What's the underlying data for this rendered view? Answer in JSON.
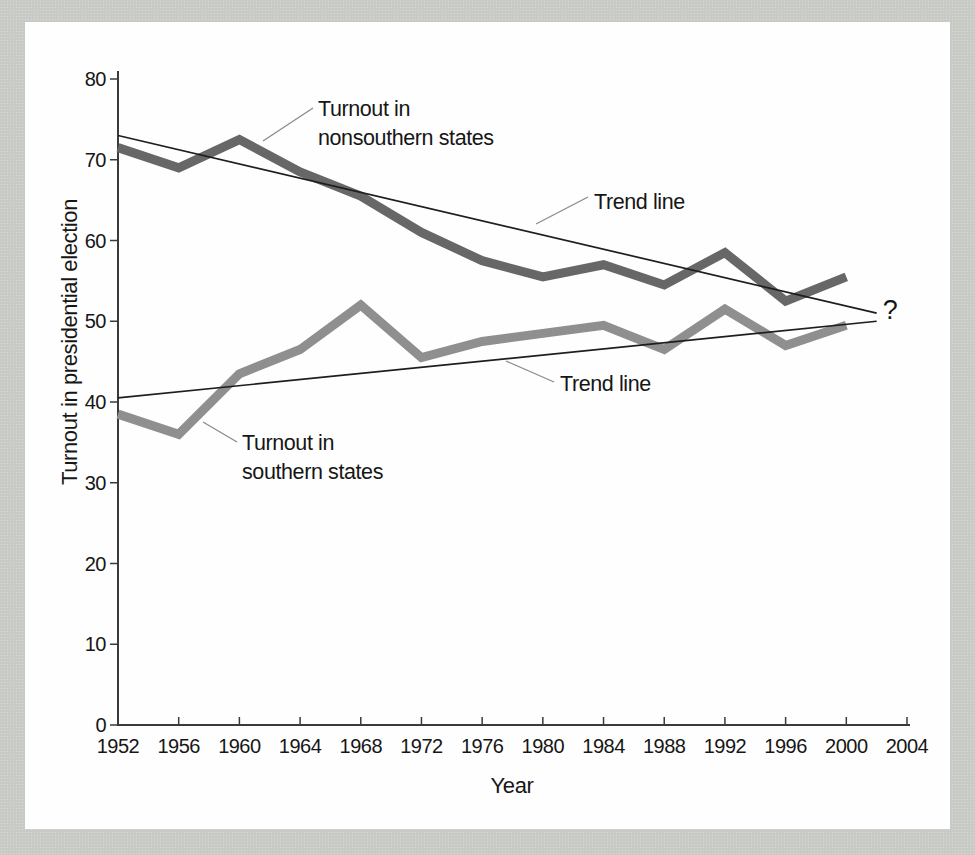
{
  "figure": {
    "background_color": "#cacdc8",
    "panel_color": "#fefefe",
    "axis_color": "#3a3a3a",
    "text_color": "#161616",
    "callout_color": "#8a8a8a",
    "trend_color": "#1e1e1e"
  },
  "chart_data": {
    "type": "line",
    "title": "",
    "xlabel": "Year",
    "ylabel": "Turnout in presidential election",
    "xlim": [
      1952,
      2004
    ],
    "ylim": [
      0,
      80
    ],
    "x_ticks": [
      1952,
      1956,
      1960,
      1964,
      1968,
      1972,
      1976,
      1980,
      1984,
      1988,
      1992,
      1996,
      2000,
      2004
    ],
    "y_ticks": [
      0,
      10,
      20,
      30,
      40,
      50,
      60,
      70,
      80
    ],
    "grid": false,
    "legend_position": "none (inline callout labels)",
    "x": [
      1952,
      1956,
      1960,
      1964,
      1968,
      1972,
      1976,
      1980,
      1984,
      1988,
      1992,
      1996,
      2000
    ],
    "series": [
      {
        "name": "Turnout in nonsouthern states",
        "color": "#676767",
        "values": [
          71.5,
          69,
          72.5,
          68.5,
          65.5,
          61,
          57.5,
          55.5,
          57,
          54.5,
          58.5,
          52.5,
          55.5
        ]
      },
      {
        "name": "Turnout in southern states",
        "color": "#8f8f8f",
        "values": [
          38.5,
          36,
          43.5,
          46.5,
          52,
          45.5,
          47.5,
          48.5,
          49.5,
          46.5,
          51.5,
          47,
          49.5
        ]
      }
    ],
    "trend_lines": [
      {
        "name": "Nonsouthern trend line",
        "start": {
          "year": 1952,
          "value": 73
        },
        "end": {
          "year": 2002,
          "value": 51
        }
      },
      {
        "name": "Southern trend line",
        "start": {
          "year": 1952,
          "value": 40.5
        },
        "end": {
          "year": 2002,
          "value": 50
        }
      }
    ],
    "annotations": [
      {
        "id": "nonsouthern-label",
        "text": "Turnout in\nnonsouthern states"
      },
      {
        "id": "trend-label-upper",
        "text": "Trend line"
      },
      {
        "id": "trend-label-lower",
        "text": "Trend line"
      },
      {
        "id": "southern-label",
        "text": "Turnout in\nsouthern states"
      },
      {
        "id": "future-question-mark",
        "text": "?"
      }
    ]
  }
}
